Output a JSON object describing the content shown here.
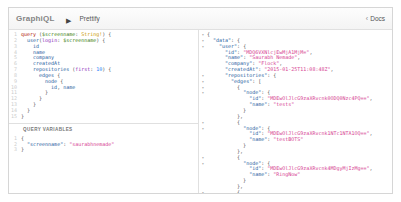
{
  "topbar": {
    "logo": "GraphiQL",
    "prettify_label": "Prettify",
    "docs_chevron": "‹",
    "docs_label": "Docs"
  },
  "syntax_colors": {
    "kw": "#B11A04",
    "vr": "#397D13",
    "ty": "#CA9800",
    "fd": "#1F61A0",
    "ar": "#8B2BB9",
    "nm": "#2882F9",
    "k": "#1F61A0",
    "s": "#D64292",
    "p": "#555555",
    "line_number": "#CCCCCC",
    "fold_arrow": "#999999"
  },
  "query_editor": {
    "lines": [
      {
        "tokens": [
          {
            "c": "kw",
            "t": "query"
          },
          {
            "c": "p",
            "t": " ("
          },
          {
            "c": "vr",
            "t": "$screenname"
          },
          {
            "c": "p",
            "t": ": "
          },
          {
            "c": "ty",
            "t": "String!"
          },
          {
            "c": "p",
            "t": ") {"
          }
        ]
      },
      {
        "tokens": [
          {
            "c": "p",
            "t": "  "
          },
          {
            "c": "fd",
            "t": "user"
          },
          {
            "c": "p",
            "t": "("
          },
          {
            "c": "ar",
            "t": "login"
          },
          {
            "c": "p",
            "t": ": "
          },
          {
            "c": "vr",
            "t": "$screenname"
          },
          {
            "c": "p",
            "t": ") {"
          }
        ]
      },
      {
        "tokens": [
          {
            "c": "p",
            "t": "    "
          },
          {
            "c": "fd",
            "t": "id"
          }
        ]
      },
      {
        "tokens": [
          {
            "c": "p",
            "t": "    "
          },
          {
            "c": "fd",
            "t": "name"
          }
        ]
      },
      {
        "tokens": [
          {
            "c": "p",
            "t": "    "
          },
          {
            "c": "fd",
            "t": "company"
          }
        ]
      },
      {
        "tokens": [
          {
            "c": "p",
            "t": "    "
          },
          {
            "c": "fd",
            "t": "createdAt"
          }
        ]
      },
      {
        "tokens": [
          {
            "c": "p",
            "t": "    "
          },
          {
            "c": "fd",
            "t": "repositories"
          },
          {
            "c": "p",
            "t": " ("
          },
          {
            "c": "ar",
            "t": "first"
          },
          {
            "c": "p",
            "t": ": "
          },
          {
            "c": "nm",
            "t": "10"
          },
          {
            "c": "p",
            "t": ") {"
          }
        ]
      },
      {
        "tokens": [
          {
            "c": "p",
            "t": "      "
          },
          {
            "c": "fd",
            "t": "edges"
          },
          {
            "c": "p",
            "t": " {"
          }
        ]
      },
      {
        "tokens": [
          {
            "c": "p",
            "t": "        "
          },
          {
            "c": "fd",
            "t": "node"
          },
          {
            "c": "p",
            "t": " {"
          }
        ]
      },
      {
        "tokens": [
          {
            "c": "p",
            "t": "          "
          },
          {
            "c": "fd",
            "t": "id"
          },
          {
            "c": "p",
            "t": ", "
          },
          {
            "c": "fd",
            "t": "name"
          }
        ]
      },
      {
        "tokens": [
          {
            "c": "p",
            "t": "        }"
          }
        ]
      },
      {
        "tokens": [
          {
            "c": "p",
            "t": "      }"
          }
        ]
      },
      {
        "tokens": [
          {
            "c": "p",
            "t": "    }"
          }
        ]
      },
      {
        "tokens": [
          {
            "c": "p",
            "t": "  }"
          }
        ]
      },
      {
        "tokens": [
          {
            "c": "p",
            "t": "}"
          }
        ]
      }
    ]
  },
  "variables": {
    "title": "Query Variables",
    "lines": [
      {
        "tokens": [
          {
            "c": "p",
            "t": "{"
          }
        ]
      },
      {
        "tokens": [
          {
            "c": "p",
            "t": "  "
          },
          {
            "c": "k",
            "t": "\"screenname\""
          },
          {
            "c": "p",
            "t": ": "
          },
          {
            "c": "s",
            "t": "\"saurabhnemade\""
          }
        ]
      },
      {
        "tokens": [
          {
            "c": "p",
            "t": "}"
          }
        ]
      }
    ]
  },
  "result": {
    "lines": [
      {
        "fold": true,
        "tokens": [
          {
            "c": "p",
            "t": "{"
          }
        ]
      },
      {
        "fold": true,
        "tokens": [
          {
            "c": "p",
            "t": "  "
          },
          {
            "c": "k",
            "t": "\"data\""
          },
          {
            "c": "p",
            "t": ": {"
          }
        ]
      },
      {
        "fold": true,
        "tokens": [
          {
            "c": "p",
            "t": "    "
          },
          {
            "c": "k",
            "t": "\"user\""
          },
          {
            "c": "p",
            "t": ": {"
          }
        ]
      },
      {
        "fold": false,
        "tokens": [
          {
            "c": "p",
            "t": "      "
          },
          {
            "c": "k",
            "t": "\"id\""
          },
          {
            "c": "p",
            "t": ": "
          },
          {
            "c": "s",
            "t": "\"MDQ6VXNlcjEwMjA1MjM=\""
          },
          {
            "c": "p",
            "t": ","
          }
        ]
      },
      {
        "fold": false,
        "tokens": [
          {
            "c": "p",
            "t": "      "
          },
          {
            "c": "k",
            "t": "\"name\""
          },
          {
            "c": "p",
            "t": ": "
          },
          {
            "c": "s",
            "t": "\"Saurabh Nemade\""
          },
          {
            "c": "p",
            "t": ","
          }
        ]
      },
      {
        "fold": false,
        "tokens": [
          {
            "c": "p",
            "t": "      "
          },
          {
            "c": "k",
            "t": "\"company\""
          },
          {
            "c": "p",
            "t": ": "
          },
          {
            "c": "s",
            "t": "\"Flock\""
          },
          {
            "c": "p",
            "t": ","
          }
        ]
      },
      {
        "fold": false,
        "tokens": [
          {
            "c": "p",
            "t": "      "
          },
          {
            "c": "k",
            "t": "\"createdAt\""
          },
          {
            "c": "p",
            "t": ": "
          },
          {
            "c": "s",
            "t": "\"2015-01-25T11:08:48Z\""
          },
          {
            "c": "p",
            "t": ","
          }
        ]
      },
      {
        "fold": true,
        "tokens": [
          {
            "c": "p",
            "t": "      "
          },
          {
            "c": "k",
            "t": "\"repositories\""
          },
          {
            "c": "p",
            "t": ": {"
          }
        ]
      },
      {
        "fold": true,
        "tokens": [
          {
            "c": "p",
            "t": "        "
          },
          {
            "c": "k",
            "t": "\"edges\""
          },
          {
            "c": "p",
            "t": ": ["
          }
        ]
      },
      {
        "fold": true,
        "tokens": [
          {
            "c": "p",
            "t": "          {"
          }
        ]
      },
      {
        "fold": true,
        "tokens": [
          {
            "c": "p",
            "t": "            "
          },
          {
            "c": "k",
            "t": "\"node\""
          },
          {
            "c": "p",
            "t": ": {"
          }
        ]
      },
      {
        "fold": false,
        "tokens": [
          {
            "c": "p",
            "t": "              "
          },
          {
            "c": "k",
            "t": "\"id\""
          },
          {
            "c": "p",
            "t": ": "
          },
          {
            "c": "s",
            "t": "\"MDEwOlJlcG9zaXRvcnk0ODQ0Nzc4PQ==\""
          },
          {
            "c": "p",
            "t": ","
          }
        ]
      },
      {
        "fold": false,
        "tokens": [
          {
            "c": "p",
            "t": "              "
          },
          {
            "c": "k",
            "t": "\"name\""
          },
          {
            "c": "p",
            "t": ": "
          },
          {
            "c": "s",
            "t": "\"tests\""
          }
        ]
      },
      {
        "fold": false,
        "tokens": [
          {
            "c": "p",
            "t": "            }"
          }
        ]
      },
      {
        "fold": false,
        "tokens": [
          {
            "c": "p",
            "t": "          },"
          }
        ]
      },
      {
        "fold": true,
        "tokens": [
          {
            "c": "p",
            "t": "          {"
          }
        ]
      },
      {
        "fold": true,
        "tokens": [
          {
            "c": "p",
            "t": "            "
          },
          {
            "c": "k",
            "t": "\"node\""
          },
          {
            "c": "p",
            "t": ": {"
          }
        ]
      },
      {
        "fold": false,
        "tokens": [
          {
            "c": "p",
            "t": "              "
          },
          {
            "c": "k",
            "t": "\"id\""
          },
          {
            "c": "p",
            "t": ": "
          },
          {
            "c": "s",
            "t": "\"MDEwOlJlcG9zaXRvcnk1NTc1NTA1OQ==\""
          },
          {
            "c": "p",
            "t": ","
          }
        ]
      },
      {
        "fold": false,
        "tokens": [
          {
            "c": "p",
            "t": "              "
          },
          {
            "c": "k",
            "t": "\"name\""
          },
          {
            "c": "p",
            "t": ": "
          },
          {
            "c": "s",
            "t": "\"testBOTS\""
          }
        ]
      },
      {
        "fold": false,
        "tokens": [
          {
            "c": "p",
            "t": "            }"
          }
        ]
      },
      {
        "fold": false,
        "tokens": [
          {
            "c": "p",
            "t": "          },"
          }
        ]
      },
      {
        "fold": true,
        "tokens": [
          {
            "c": "p",
            "t": "          {"
          }
        ]
      },
      {
        "fold": true,
        "tokens": [
          {
            "c": "p",
            "t": "            "
          },
          {
            "c": "k",
            "t": "\"node\""
          },
          {
            "c": "p",
            "t": ": {"
          }
        ]
      },
      {
        "fold": false,
        "tokens": [
          {
            "c": "p",
            "t": "              "
          },
          {
            "c": "k",
            "t": "\"id\""
          },
          {
            "c": "p",
            "t": ": "
          },
          {
            "c": "s",
            "t": "\"MDEwOlJlcG9zaXRvcnk4MDgyMjIzMg==\""
          },
          {
            "c": "p",
            "t": ","
          }
        ]
      },
      {
        "fold": false,
        "tokens": [
          {
            "c": "p",
            "t": "              "
          },
          {
            "c": "k",
            "t": "\"name\""
          },
          {
            "c": "p",
            "t": ": "
          },
          {
            "c": "s",
            "t": "\"RingNow\""
          }
        ]
      },
      {
        "fold": false,
        "tokens": [
          {
            "c": "p",
            "t": "            }"
          }
        ]
      },
      {
        "fold": false,
        "tokens": [
          {
            "c": "p",
            "t": "          },"
          }
        ]
      },
      {
        "fold": true,
        "tokens": [
          {
            "c": "p",
            "t": "          {"
          }
        ]
      }
    ]
  }
}
